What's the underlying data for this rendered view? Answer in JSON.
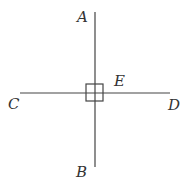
{
  "diagram": {
    "type": "perpendicular-lines",
    "colors": {
      "stroke": "#444444",
      "label": "#333333",
      "background": "#ffffff"
    },
    "lines": [
      {
        "name": "AB",
        "from": "A",
        "to": "B",
        "x1": 95,
        "y1": 12,
        "x2": 95,
        "y2": 167
      },
      {
        "name": "CD",
        "from": "C",
        "to": "D",
        "x1": 20,
        "y1": 93,
        "x2": 170,
        "y2": 93
      }
    ],
    "intersection": {
      "label": "E",
      "x": 95,
      "y": 93
    },
    "right_angle_marker": {
      "x": 85,
      "y": 84,
      "size": 18
    },
    "labels": {
      "A": "A",
      "B": "B",
      "C": "C",
      "D": "D",
      "E": "E"
    }
  }
}
